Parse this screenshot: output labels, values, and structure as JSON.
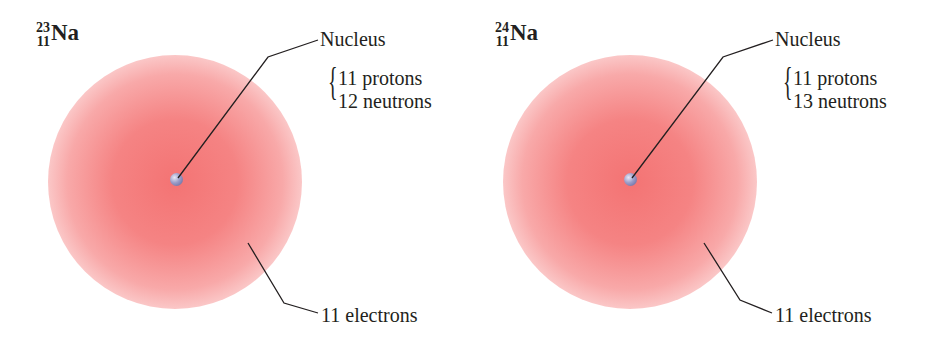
{
  "atoms": [
    {
      "symbol": "Na",
      "mass_number": "23",
      "atomic_number": "11",
      "nucleus_label": "Nucleus",
      "protons": "11 protons",
      "neutrons": "12 neutrons",
      "electrons": "11 electrons"
    },
    {
      "symbol": "Na",
      "mass_number": "24",
      "atomic_number": "11",
      "nucleus_label": "Nucleus",
      "protons": "11 protons",
      "neutrons": "13 neutrons",
      "electrons": "11 electrons"
    }
  ],
  "colors": {
    "electron_cloud": "#f36c6c",
    "nucleus": "#8f91c0",
    "text": "#231f20"
  }
}
